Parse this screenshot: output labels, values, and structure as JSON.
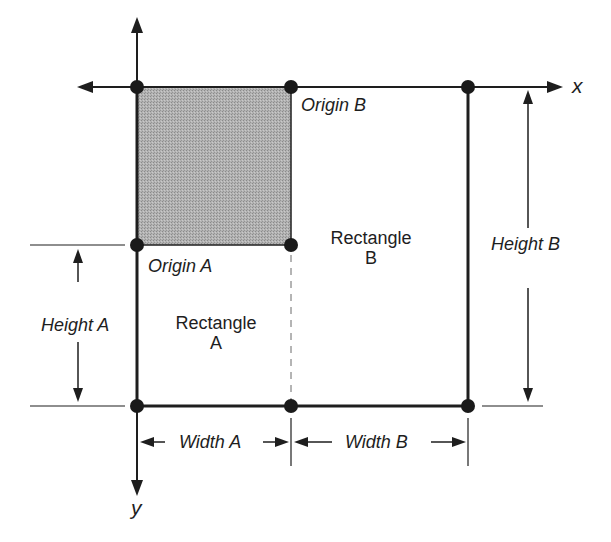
{
  "diagram": {
    "title": "",
    "axes": {
      "x_label": "x",
      "y_label": "y"
    },
    "origins": {
      "origin_a": "Origin A",
      "origin_b": "Origin B"
    },
    "rectangles": {
      "rect_a_line1": "Rectangle",
      "rect_a_line2": "A",
      "rect_b_line1": "Rectangle",
      "rect_b_line2": "B"
    },
    "dimensions": {
      "height_a": "Height A",
      "height_b": "Height B",
      "width_a": "Width A",
      "width_b": "Width B"
    },
    "colors": {
      "line": "#1e1e1e",
      "shaded_fill": "#a9a9a9",
      "background": "#ffffff"
    }
  }
}
